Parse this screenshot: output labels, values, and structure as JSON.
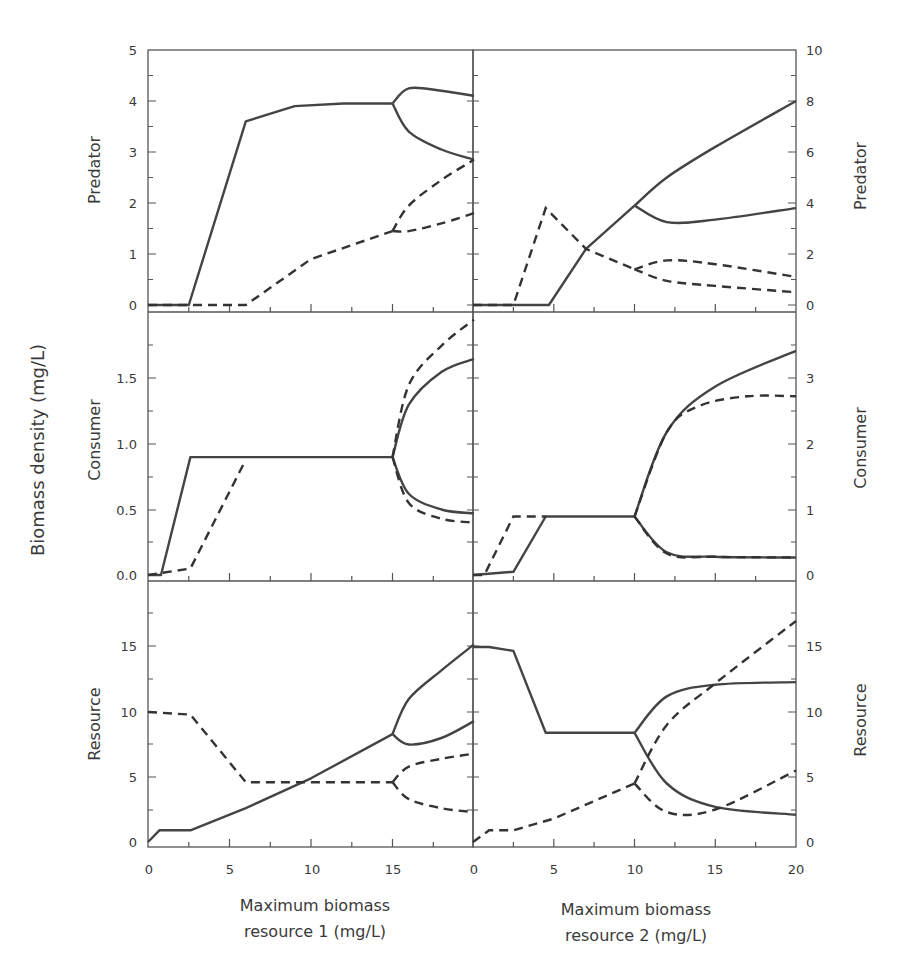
{
  "figure": {
    "y_axis_title": "Biomass density (mg/L)",
    "x_axis_title_left_line1": "Maximum biomass",
    "x_axis_title_left_line2": "resource 1 (mg/L)",
    "x_axis_title_right_line1": "Maximum biomass",
    "x_axis_title_right_line2": "resource 2 (mg/L)",
    "row_labels": [
      "Predator",
      "Consumer",
      "Resource"
    ],
    "left_x_ticks": [
      "0",
      "5",
      "10",
      "15",
      "0"
    ],
    "right_x_ticks": [
      "0",
      "5",
      "10",
      "15",
      "20"
    ],
    "left_predator_ticks": [
      "0",
      "1",
      "2",
      "3",
      "4",
      "5"
    ],
    "right_predator_ticks": [
      "0",
      "2",
      "4",
      "6",
      "8",
      "10"
    ],
    "left_consumer_ticks": [
      "0.0",
      "0.5",
      "1.0",
      "1.5"
    ],
    "right_consumer_ticks": [
      "0",
      "1",
      "2",
      "3"
    ],
    "left_resource_ticks": [
      "0",
      "5",
      "10",
      "15"
    ],
    "right_resource_ticks": [
      "0",
      "5",
      "10",
      "15"
    ]
  },
  "chart_data": [
    {
      "type": "line",
      "title": "Predator vs max biomass resource 1",
      "xlabel": "Maximum biomass resource 1 (mg/L)",
      "ylabel": "Predator",
      "xlim": [
        0,
        20
      ],
      "ylim": [
        0,
        5
      ],
      "series": [
        {
          "name": "solid (stable)",
          "style": "solid",
          "x": [
            0,
            2.5,
            6,
            9,
            12,
            15
          ],
          "y": [
            0,
            0,
            3.6,
            3.9,
            3.95,
            3.95
          ]
        },
        {
          "name": "solid upper branch",
          "style": "solid",
          "x": [
            15,
            16,
            18,
            20
          ],
          "y": [
            3.95,
            4.25,
            4.2,
            4.1
          ]
        },
        {
          "name": "solid lower branch",
          "style": "solid",
          "x": [
            15,
            16,
            18,
            20
          ],
          "y": [
            3.95,
            3.4,
            3.05,
            2.85
          ]
        },
        {
          "name": "dashed",
          "style": "dashed",
          "x": [
            0,
            6,
            10,
            15
          ],
          "y": [
            0,
            0,
            0.9,
            1.45
          ]
        },
        {
          "name": "dashed upper branch",
          "style": "dashed",
          "x": [
            15,
            16,
            18,
            20
          ],
          "y": [
            1.45,
            1.95,
            2.45,
            2.85
          ]
        },
        {
          "name": "dashed lower branch",
          "style": "dashed",
          "x": [
            15,
            16,
            18,
            20
          ],
          "y": [
            1.45,
            1.45,
            1.6,
            1.8
          ]
        }
      ]
    },
    {
      "type": "line",
      "title": "Predator vs max biomass resource 2",
      "xlabel": "Maximum biomass resource 2 (mg/L)",
      "ylabel": "Predator",
      "xlim": [
        0,
        20
      ],
      "ylim": [
        0,
        10
      ],
      "series": [
        {
          "name": "solid",
          "style": "solid",
          "x": [
            0,
            4.7,
            7,
            10
          ],
          "y": [
            0,
            0,
            2.2,
            3.9
          ]
        },
        {
          "name": "solid upper branch",
          "style": "solid",
          "x": [
            10,
            12,
            15,
            20
          ],
          "y": [
            3.9,
            5.0,
            6.2,
            8.0
          ]
        },
        {
          "name": "solid lower branch",
          "style": "solid",
          "x": [
            10,
            12,
            15,
            20
          ],
          "y": [
            3.9,
            3.25,
            3.35,
            3.8
          ]
        },
        {
          "name": "dashed",
          "style": "dashed",
          "x": [
            0,
            2.5,
            4.5,
            7,
            10
          ],
          "y": [
            0,
            0,
            3.8,
            2.2,
            1.4
          ]
        },
        {
          "name": "dashed upper branch",
          "style": "dashed",
          "x": [
            10,
            12,
            15,
            20
          ],
          "y": [
            1.4,
            1.75,
            1.6,
            1.1
          ]
        },
        {
          "name": "dashed lower branch",
          "style": "dashed",
          "x": [
            10,
            12,
            15,
            20
          ],
          "y": [
            1.4,
            0.95,
            0.75,
            0.5
          ]
        }
      ]
    },
    {
      "type": "line",
      "title": "Consumer vs max biomass resource 1",
      "xlabel": "Maximum biomass resource 1 (mg/L)",
      "ylabel": "Consumer",
      "xlim": [
        0,
        20
      ],
      "ylim": [
        0,
        2
      ],
      "series": [
        {
          "name": "solid",
          "style": "solid",
          "x": [
            0,
            0.8,
            2.6,
            15
          ],
          "y": [
            0,
            0,
            0.9,
            0.9
          ]
        },
        {
          "name": "solid upper branch",
          "style": "solid",
          "x": [
            15,
            16,
            18,
            20
          ],
          "y": [
            0.9,
            1.3,
            1.55,
            1.65
          ]
        },
        {
          "name": "solid lower branch",
          "style": "solid",
          "x": [
            15,
            16,
            18,
            20
          ],
          "y": [
            0.9,
            0.62,
            0.5,
            0.47
          ]
        },
        {
          "name": "dashed",
          "style": "dashed",
          "x": [
            0,
            2.6,
            6
          ],
          "y": [
            0,
            0.05,
            0.88
          ]
        },
        {
          "name": "dashed upper branch",
          "style": "dashed",
          "x": [
            15,
            16,
            18,
            20
          ],
          "y": [
            0.9,
            1.45,
            1.75,
            1.95
          ]
        },
        {
          "name": "dashed lower branch",
          "style": "dashed",
          "x": [
            15,
            16,
            18,
            20
          ],
          "y": [
            0.9,
            0.55,
            0.43,
            0.4
          ]
        }
      ]
    },
    {
      "type": "line",
      "title": "Consumer vs max biomass resource 2",
      "xlabel": "Maximum biomass resource 2 (mg/L)",
      "ylabel": "Consumer",
      "xlim": [
        0,
        20
      ],
      "ylim": [
        0,
        4
      ],
      "series": [
        {
          "name": "solid",
          "style": "solid",
          "x": [
            0,
            2.5,
            4.5,
            10
          ],
          "y": [
            0,
            0.05,
            0.9,
            0.9
          ]
        },
        {
          "name": "solid upper branch",
          "style": "solid",
          "x": [
            10,
            12,
            15,
            20
          ],
          "y": [
            0.9,
            2.2,
            2.9,
            3.45
          ]
        },
        {
          "name": "solid lower branch",
          "style": "solid",
          "x": [
            10,
            12,
            15,
            20
          ],
          "y": [
            0.9,
            0.35,
            0.28,
            0.27
          ]
        },
        {
          "name": "dashed",
          "style": "dashed",
          "x": [
            0,
            0.7,
            2.5,
            4.5
          ],
          "y": [
            0,
            0,
            0.9,
            0.9
          ]
        },
        {
          "name": "dashed upper branch",
          "style": "dashed",
          "x": [
            10,
            12,
            14,
            17,
            20
          ],
          "y": [
            0.9,
            2.2,
            2.6,
            2.75,
            2.75
          ]
        },
        {
          "name": "dashed lower branch",
          "style": "dashed",
          "x": [
            10,
            12,
            15,
            20
          ],
          "y": [
            0.9,
            0.33,
            0.28,
            0.27
          ]
        }
      ]
    },
    {
      "type": "line",
      "title": "Resource vs max biomass resource 1",
      "xlabel": "Maximum biomass resource 1 (mg/L)",
      "ylabel": "Resource",
      "xlim": [
        0,
        20
      ],
      "ylim": [
        0,
        20
      ],
      "series": [
        {
          "name": "solid",
          "style": "solid",
          "x": [
            0,
            0.7,
            2.6,
            6,
            10,
            15
          ],
          "y": [
            0,
            0.9,
            0.9,
            2.6,
            4.9,
            8.3
          ]
        },
        {
          "name": "solid upper branch",
          "style": "solid",
          "x": [
            15,
            16,
            18,
            20
          ],
          "y": [
            8.3,
            11,
            13.2,
            15.2
          ]
        },
        {
          "name": "solid lower branch",
          "style": "solid",
          "x": [
            15,
            16,
            18,
            20
          ],
          "y": [
            8.3,
            7.5,
            8.0,
            9.3
          ]
        },
        {
          "name": "dashed",
          "style": "dashed",
          "x": [
            0,
            2.6,
            6,
            15
          ],
          "y": [
            10,
            9.8,
            4.6,
            4.6
          ]
        },
        {
          "name": "dashed upper branch",
          "style": "dashed",
          "x": [
            15,
            16,
            18,
            20
          ],
          "y": [
            4.6,
            5.8,
            6.4,
            6.8
          ]
        },
        {
          "name": "dashed lower branch",
          "style": "dashed",
          "x": [
            15,
            16,
            18,
            20
          ],
          "y": [
            4.6,
            3.3,
            2.6,
            2.3
          ]
        }
      ]
    },
    {
      "type": "line",
      "title": "Resource vs max biomass resource 2",
      "xlabel": "Maximum biomass resource 2 (mg/L)",
      "ylabel": "Resource",
      "xlim": [
        0,
        20
      ],
      "ylim": [
        0,
        20
      ],
      "series": [
        {
          "name": "solid",
          "style": "solid",
          "x": [
            0,
            1,
            2.5,
            4.5,
            10
          ],
          "y": [
            15,
            15,
            14.7,
            8.4,
            8.4
          ]
        },
        {
          "name": "solid upper branch",
          "style": "solid",
          "x": [
            10,
            12,
            15,
            20
          ],
          "y": [
            8.4,
            11.2,
            12.1,
            12.3
          ]
        },
        {
          "name": "solid lower branch",
          "style": "solid",
          "x": [
            10,
            12,
            15,
            20
          ],
          "y": [
            8.4,
            4.5,
            2.7,
            2.1
          ]
        },
        {
          "name": "dashed",
          "style": "dashed",
          "x": [
            0,
            1,
            2.5,
            5,
            10
          ],
          "y": [
            0,
            0.9,
            0.9,
            1.8,
            4.5
          ]
        },
        {
          "name": "dashed upper branch",
          "style": "dashed",
          "x": [
            10,
            12,
            15,
            20
          ],
          "y": [
            4.5,
            9.0,
            12.2,
            17.0
          ]
        },
        {
          "name": "dashed lower branch",
          "style": "dashed",
          "x": [
            10,
            12,
            15,
            20
          ],
          "y": [
            4.5,
            2.3,
            2.5,
            5.5
          ]
        }
      ]
    }
  ]
}
